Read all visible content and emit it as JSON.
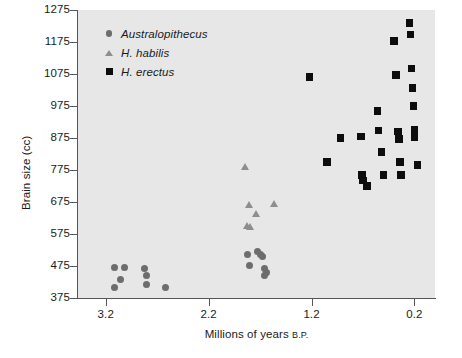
{
  "chart_data": {
    "type": "scatter",
    "title": "",
    "xlabel": "Millions of years B.P.",
    "ylabel": "Brain size (cc)",
    "xlim": [
      3.47,
      0.0
    ],
    "ylim": [
      375,
      1275
    ],
    "x_reversed": true,
    "grid": false,
    "background_color": "#e7e7e7",
    "xticks": [
      "3.2",
      "2.2",
      "1.2",
      "0.2"
    ],
    "xtick_values": [
      3.2,
      2.2,
      1.2,
      0.2
    ],
    "yticks": [
      "375",
      "475",
      "575",
      "675",
      "775",
      "875",
      "975",
      "1075",
      "1175",
      "1275"
    ],
    "ytick_values": [
      375,
      475,
      575,
      675,
      775,
      875,
      975,
      1075,
      1175,
      1275
    ],
    "legend_position": "upper left",
    "series": [
      {
        "name": "Australopithecus",
        "marker": "circle",
        "color": "#6d6d6d",
        "points": [
          {
            "x": 3.12,
            "y": 470
          },
          {
            "x": 3.02,
            "y": 470
          },
          {
            "x": 3.06,
            "y": 432
          },
          {
            "x": 3.12,
            "y": 408
          },
          {
            "x": 2.82,
            "y": 468
          },
          {
            "x": 2.8,
            "y": 445
          },
          {
            "x": 2.8,
            "y": 418
          },
          {
            "x": 2.62,
            "y": 408
          },
          {
            "x": 1.82,
            "y": 510
          },
          {
            "x": 1.8,
            "y": 478
          },
          {
            "x": 1.73,
            "y": 520
          },
          {
            "x": 1.7,
            "y": 512
          },
          {
            "x": 1.68,
            "y": 505
          },
          {
            "x": 1.66,
            "y": 468
          },
          {
            "x": 1.64,
            "y": 455
          },
          {
            "x": 1.66,
            "y": 444
          }
        ]
      },
      {
        "name": "H. habilis",
        "marker": "triangle",
        "color": "#8e8e8e",
        "points": [
          {
            "x": 1.84,
            "y": 785
          },
          {
            "x": 1.8,
            "y": 668
          },
          {
            "x": 1.56,
            "y": 670
          },
          {
            "x": 1.74,
            "y": 640
          },
          {
            "x": 1.82,
            "y": 600
          },
          {
            "x": 1.79,
            "y": 598
          }
        ]
      },
      {
        "name": "H. erectus",
        "marker": "square",
        "color": "#0d0d0d",
        "points": [
          {
            "x": 1.22,
            "y": 1065
          },
          {
            "x": 1.05,
            "y": 800
          },
          {
            "x": 0.92,
            "y": 875
          },
          {
            "x": 0.72,
            "y": 880
          },
          {
            "x": 0.71,
            "y": 760
          },
          {
            "x": 0.7,
            "y": 742
          },
          {
            "x": 0.66,
            "y": 725
          },
          {
            "x": 0.56,
            "y": 960
          },
          {
            "x": 0.55,
            "y": 898
          },
          {
            "x": 0.52,
            "y": 832
          },
          {
            "x": 0.5,
            "y": 760
          },
          {
            "x": 0.4,
            "y": 1178
          },
          {
            "x": 0.38,
            "y": 1072
          },
          {
            "x": 0.36,
            "y": 895
          },
          {
            "x": 0.35,
            "y": 872
          },
          {
            "x": 0.34,
            "y": 800
          },
          {
            "x": 0.33,
            "y": 760
          },
          {
            "x": 0.25,
            "y": 1235
          },
          {
            "x": 0.24,
            "y": 1198
          },
          {
            "x": 0.23,
            "y": 1092
          },
          {
            "x": 0.22,
            "y": 1032
          },
          {
            "x": 0.21,
            "y": 975
          },
          {
            "x": 0.2,
            "y": 900
          },
          {
            "x": 0.2,
            "y": 878
          },
          {
            "x": 0.17,
            "y": 790
          }
        ]
      }
    ]
  }
}
